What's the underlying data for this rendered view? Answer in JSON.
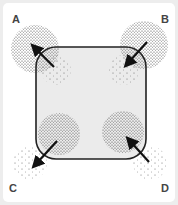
{
  "diagram": {
    "labels": {
      "a": "A",
      "b": "B",
      "c": "C",
      "d": "D"
    },
    "colors": {
      "background": "#ededed",
      "panel": "#ffffff",
      "shape_fill": "#ebebeb",
      "stroke": "#222222",
      "dots": "#333333"
    },
    "corners": [
      {
        "id": "A",
        "arrow_direction": "outward",
        "dense_cloud": "outside",
        "sparse_cloud": "inside"
      },
      {
        "id": "B",
        "arrow_direction": "inward",
        "dense_cloud": "outside",
        "sparse_cloud": "inside"
      },
      {
        "id": "C",
        "arrow_direction": "outward",
        "dense_cloud": "inside",
        "sparse_cloud": "outside"
      },
      {
        "id": "D",
        "arrow_direction": "inward",
        "dense_cloud": "inside",
        "sparse_cloud": "outside"
      }
    ]
  }
}
